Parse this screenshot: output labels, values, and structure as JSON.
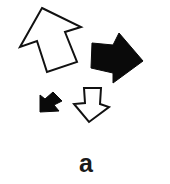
{
  "figure": {
    "panel_label": "a",
    "colors": {
      "background": "#ffffff",
      "outline": "#111111",
      "filled": "#0a0a0a",
      "hollow": "#ffffff"
    },
    "arrows": [
      {
        "name": "large-hollow-arrow",
        "direction": "up-left",
        "fill": "hollow",
        "points": "42,8 81,27 65,32 77,62 47,72 37,41 20,47"
      },
      {
        "name": "large-filled-arrow",
        "direction": "right",
        "fill": "filled",
        "points": "92,43 113,45 119,33 143,61 113,83 113,73 91,68"
      },
      {
        "name": "small-filled-arrow",
        "direction": "down-left",
        "fill": "filled",
        "points": "40,112 40,95 45,99 53,92 62,101 54,105 59,111"
      },
      {
        "name": "small-hollow-arrow",
        "direction": "down",
        "fill": "hollow",
        "points": "84,88 101,88 100,104 109,107 89,122 74,104 85,103"
      }
    ]
  }
}
